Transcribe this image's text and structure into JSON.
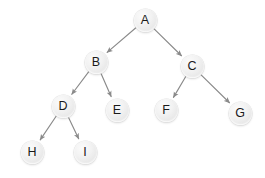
{
  "diagram": {
    "type": "binary-tree",
    "background_color": "#ffffff",
    "node_fill_color": "#eeeeee",
    "node_label_color": "#1a1a1a",
    "edge_color": "#8a8a8a",
    "node_radius": 11.5,
    "nodes": [
      {
        "id": "A",
        "label": "A",
        "cx": 145,
        "cy": 20,
        "depth": 0
      },
      {
        "id": "B",
        "label": "B",
        "cx": 96,
        "cy": 62,
        "depth": 1
      },
      {
        "id": "C",
        "label": "C",
        "cx": 192,
        "cy": 66,
        "depth": 1
      },
      {
        "id": "D",
        "label": "D",
        "cx": 63,
        "cy": 106,
        "depth": 2
      },
      {
        "id": "E",
        "label": "E",
        "cx": 117,
        "cy": 110,
        "depth": 2
      },
      {
        "id": "F",
        "label": "F",
        "cx": 166,
        "cy": 110,
        "depth": 2
      },
      {
        "id": "G",
        "label": "G",
        "cx": 240,
        "cy": 113,
        "depth": 2
      },
      {
        "id": "H",
        "label": "H",
        "cx": 32,
        "cy": 152,
        "depth": 3
      },
      {
        "id": "I",
        "label": "I",
        "cx": 85,
        "cy": 152,
        "depth": 3
      }
    ],
    "edges": [
      {
        "from": "A",
        "to": "B",
        "directed": true
      },
      {
        "from": "A",
        "to": "C",
        "directed": true
      },
      {
        "from": "B",
        "to": "D",
        "directed": true
      },
      {
        "from": "B",
        "to": "E",
        "directed": true
      },
      {
        "from": "C",
        "to": "F",
        "directed": true
      },
      {
        "from": "C",
        "to": "G",
        "directed": true
      },
      {
        "from": "D",
        "to": "H",
        "directed": true
      },
      {
        "from": "D",
        "to": "I",
        "directed": true
      }
    ]
  }
}
